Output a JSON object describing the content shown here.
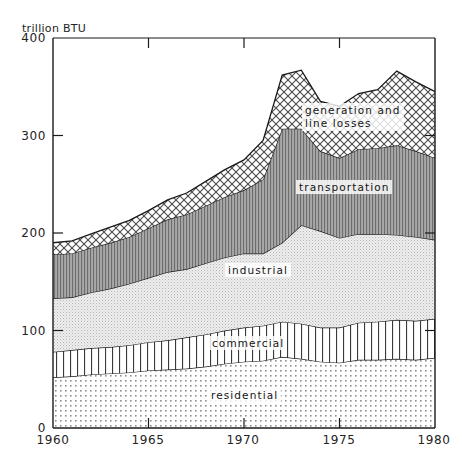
{
  "chart_data": {
    "type": "area",
    "stacked": true,
    "title": "",
    "xlabel": "",
    "ylabel": "trillion BTU",
    "ylim": [
      0,
      400
    ],
    "xlim": [
      1960,
      1980
    ],
    "yticks": [
      0,
      100,
      200,
      300,
      400
    ],
    "xticks": [
      1960,
      1965,
      1970,
      1975,
      1980
    ],
    "grid": false,
    "legend": "inline-labels",
    "x": [
      1960,
      1961,
      1962,
      1963,
      1964,
      1965,
      1966,
      1967,
      1968,
      1969,
      1970,
      1971,
      1972,
      1973,
      1974,
      1975,
      1976,
      1977,
      1978,
      1979,
      1980
    ],
    "series": [
      {
        "name": "residential",
        "fill": "fine-dot-grid",
        "values": [
          52,
          53,
          55,
          56,
          57,
          59,
          60,
          61,
          63,
          66,
          68,
          69,
          73,
          71,
          68,
          67,
          70,
          70,
          71,
          70,
          72
        ]
      },
      {
        "name": "commercial",
        "fill": "vertical-lines",
        "values": [
          26,
          27,
          27,
          27,
          28,
          29,
          30,
          32,
          33,
          34,
          35,
          36,
          36,
          36,
          35,
          36,
          38,
          39,
          40,
          40,
          40
        ]
      },
      {
        "name": "industrial",
        "fill": "light-stipple",
        "values": [
          55,
          54,
          57,
          60,
          63,
          66,
          70,
          70,
          73,
          75,
          76,
          74,
          81,
          101,
          99,
          92,
          91,
          90,
          87,
          86,
          81
        ]
      },
      {
        "name": "transportation",
        "fill": "dense-vertical-hatch",
        "values": [
          45,
          45,
          46,
          47,
          48,
          51,
          54,
          56,
          59,
          62,
          65,
          76,
          117,
          99,
          82,
          82,
          87,
          88,
          92,
          88,
          84
        ]
      },
      {
        "name": "generation and line losses",
        "fill": "cross-hatch",
        "values": [
          12,
          13,
          14,
          16,
          17,
          18,
          20,
          22,
          25,
          28,
          31,
          40,
          55,
          60,
          51,
          53,
          57,
          60,
          76,
          71,
          68
        ]
      }
    ],
    "cumulative_totals": [
      190,
      192,
      199,
      206,
      213,
      223,
      234,
      241,
      253,
      265,
      275,
      295,
      362,
      367,
      335,
      330,
      343,
      347,
      366,
      355,
      345
    ],
    "axis_unit": "trillion BTU"
  },
  "labels": {
    "y_unit": "trillion BTU",
    "series": {
      "generation_line1": "generation and",
      "generation_line2": "line losses",
      "transportation": "transportation",
      "industrial": "industrial",
      "commercial": "commercial",
      "residential": "residential"
    },
    "yticks": [
      "400",
      "300",
      "200",
      "100",
      "0"
    ],
    "xticks": [
      "1960",
      "1965",
      "1970",
      "1975",
      "1980"
    ]
  },
  "colors": {
    "axis": "#1a1a1a",
    "text": "#232323",
    "transportation_fill": "#9a9a9a",
    "industrial_fill": "#e2e2e2",
    "background": "#ffffff"
  }
}
